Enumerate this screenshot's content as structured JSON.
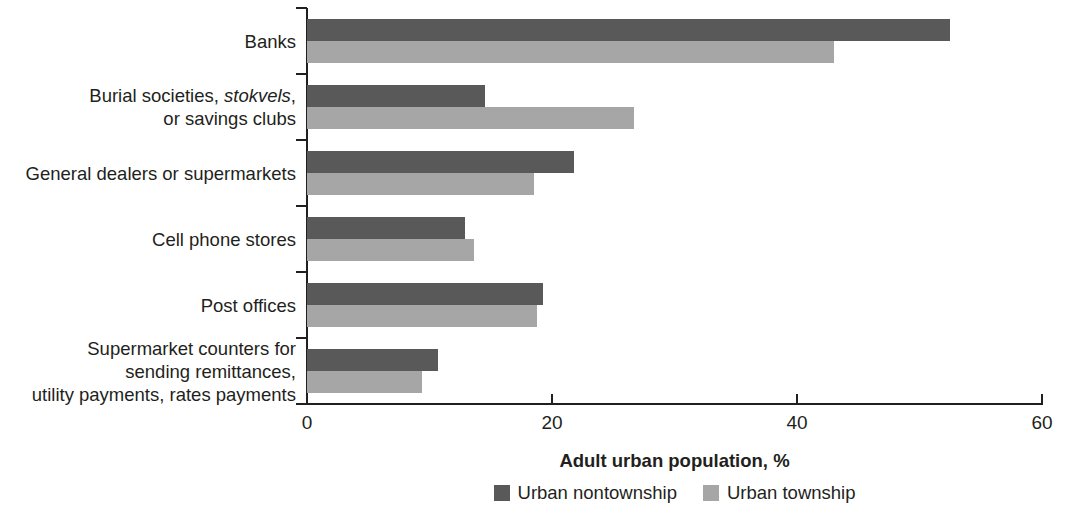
{
  "chart_data": {
    "type": "bar",
    "orientation": "horizontal",
    "title": "",
    "xlabel": "Adult urban population, %",
    "ylabel": "",
    "xlim": [
      0,
      60
    ],
    "xticks": [
      0,
      20,
      40,
      60
    ],
    "xtick_labels": [
      "0",
      "20",
      "40",
      "60"
    ],
    "grid": false,
    "legend_position": "bottom-center",
    "categories": [
      "Banks",
      "Burial societies, stokvels,\nor savings clubs",
      "General dealers or supermarkets",
      "Cell phone stores",
      "Post offices",
      "Supermarket counters for\nsending remittances,\nutility payments, rates payments"
    ],
    "category_italic_words": [
      "stokvels"
    ],
    "series": [
      {
        "name": "Urban nontownship",
        "color": "#595959",
        "values": [
          52.5,
          14.5,
          21.8,
          12.9,
          19.3,
          10.7
        ]
      },
      {
        "name": "Urban township",
        "color": "#a6a6a6",
        "values": [
          43.0,
          26.7,
          18.5,
          13.6,
          18.8,
          9.4
        ]
      }
    ]
  },
  "legend": {
    "items": [
      {
        "label": "Urban nontownship",
        "series": 0
      },
      {
        "label": "Urban township",
        "series": 1
      }
    ]
  },
  "axis": {
    "x_title": "Adult urban population, %"
  }
}
